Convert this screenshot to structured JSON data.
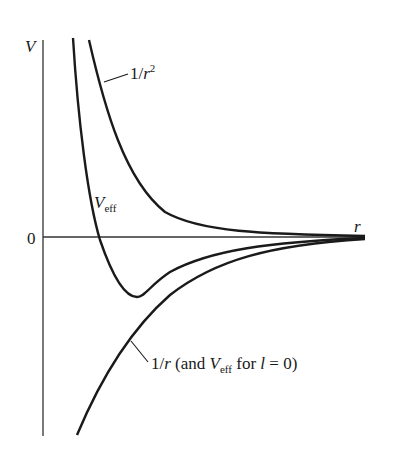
{
  "diagram": {
    "axes": {
      "y_label": "V",
      "x_label": "r",
      "zero_label": "0"
    },
    "curves": [
      {
        "name": "inverse-square",
        "label_main": "1/",
        "label_var": "r",
        "label_sup": "2"
      },
      {
        "name": "effective-potential",
        "label_var": "V",
        "label_sub": "eff"
      },
      {
        "name": "coulomb",
        "label_pre": "1/",
        "label_var": "r",
        "label_mid": " (and ",
        "label_var2": "V",
        "label_sub": "eff",
        "label_post": " for ",
        "label_var3": "l",
        "label_end": " = 0)"
      }
    ],
    "colors": {
      "ink": "#1a1a1a",
      "background": "#ffffff"
    }
  }
}
